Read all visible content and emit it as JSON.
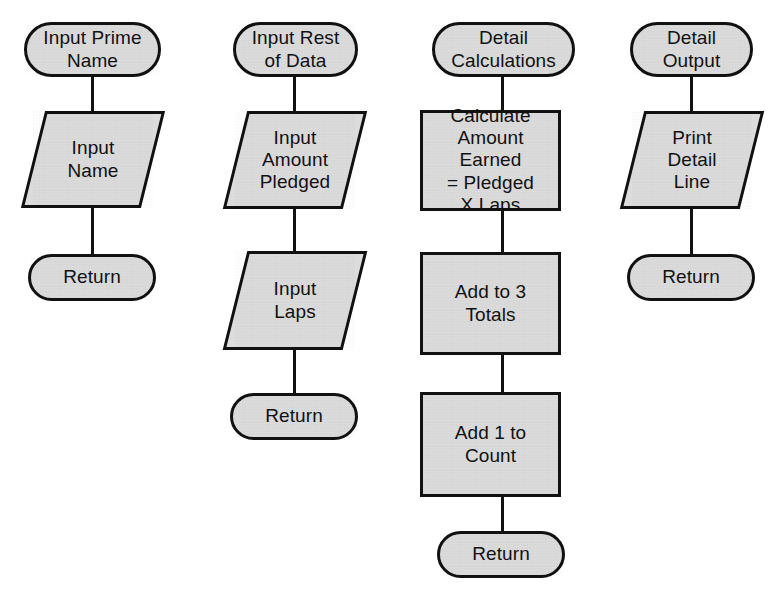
{
  "diagram": {
    "fill_color": "#dcdcdc",
    "line_color": "#111111",
    "background_color": "#ffffff"
  },
  "modules": [
    {
      "id": "input-prime-name",
      "name": "Input Prime Name",
      "nodes": [
        {
          "shape": "terminal",
          "text": "Input Prime\nName"
        },
        {
          "shape": "io",
          "text": "Input\nName"
        },
        {
          "shape": "terminal",
          "text": "Return"
        }
      ]
    },
    {
      "id": "input-rest-of-data",
      "name": "Input Rest of Data",
      "nodes": [
        {
          "shape": "terminal",
          "text": "Input Rest\nof Data"
        },
        {
          "shape": "io",
          "text": "Input\nAmount\nPledged"
        },
        {
          "shape": "io",
          "text": "Input\nLaps"
        },
        {
          "shape": "terminal",
          "text": "Return"
        }
      ]
    },
    {
      "id": "detail-calculations",
      "name": "Detail Calculations",
      "nodes": [
        {
          "shape": "terminal",
          "text": "Detail\nCalculations"
        },
        {
          "shape": "process",
          "text": "Calculate\nAmount Earned\n= Pledged\nX Laps"
        },
        {
          "shape": "process",
          "text": "Add to 3\nTotals"
        },
        {
          "shape": "process",
          "text": "Add 1 to\nCount"
        },
        {
          "shape": "terminal",
          "text": "Return"
        }
      ]
    },
    {
      "id": "detail-output",
      "name": "Detail Output",
      "nodes": [
        {
          "shape": "terminal",
          "text": "Detail\nOutput"
        },
        {
          "shape": "io",
          "text": "Print\nDetail\nLine"
        },
        {
          "shape": "terminal",
          "text": "Return"
        }
      ]
    }
  ]
}
